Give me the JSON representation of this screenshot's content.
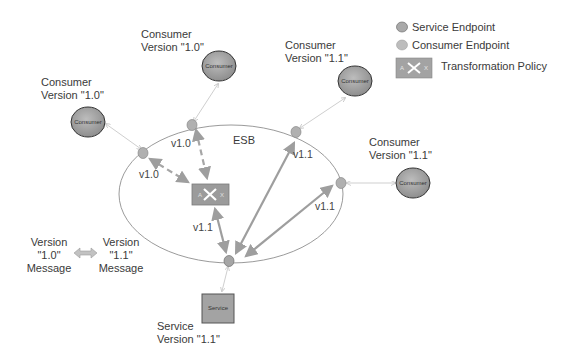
{
  "diagram": {
    "bus_label": "ESB",
    "consumers": [
      {
        "id": "c1",
        "label_line1": "Consumer",
        "label_line2": "Version \"1.0\"",
        "node_text": "Consumer"
      },
      {
        "id": "c2",
        "label_line1": "Consumer",
        "label_line2": "Version \"1.0\"",
        "node_text": "Consumer"
      },
      {
        "id": "c3",
        "label_line1": "Consumer",
        "label_line2": "Version \"1.1\"",
        "node_text": "Consumer"
      },
      {
        "id": "c4",
        "label_line1": "Consumer",
        "label_line2": "Version \"1.1\"",
        "node_text": "Consumer"
      }
    ],
    "service": {
      "label_line1": "Service",
      "label_line2": "Version \"1.1\"",
      "node_text": "Service"
    },
    "edge_labels": {
      "c1_endpoint": "v1.0",
      "c2_endpoint": "v1.0",
      "c3_endpoint": "v1.1",
      "c4_endpoint": "v1.1",
      "transform_to_service": "v1.1"
    },
    "message_legend": {
      "left_line1": "Version",
      "left_line2": "\"1.0\"",
      "left_line3": "Message",
      "right_line1": "Version",
      "right_line2": "\"1.1\"",
      "right_line3": "Message"
    }
  },
  "legend": {
    "items": [
      {
        "label": "Service Endpoint",
        "icon": "dark-ellipse"
      },
      {
        "label": "Consumer Endpoint",
        "icon": "light-ellipse"
      },
      {
        "label": "Transformation Policy",
        "icon": "transform-box"
      }
    ]
  },
  "colors": {
    "node_fill": "#a9a9a9",
    "endpoint_fill": "#b5b5b5",
    "arrow": "#9e9e9e",
    "thin_line": "#cfcfcf",
    "ellipse_stroke": "#8f8f8f"
  }
}
